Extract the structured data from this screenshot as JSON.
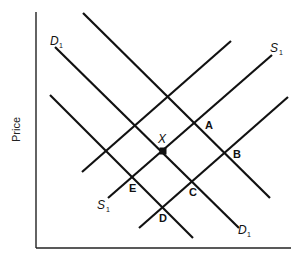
{
  "diagram": {
    "y_axis_label": "Price",
    "x_axis_label": "",
    "curve_labels": {
      "demand_top_left": {
        "main": "D",
        "sub": "1"
      },
      "demand_bottom_right": {
        "main": "D",
        "sub": "1"
      },
      "supply_top_right": {
        "main": "S",
        "sub": "1"
      },
      "supply_bottom_left": {
        "main": "S",
        "sub": "1"
      }
    },
    "points": {
      "x": "X",
      "a": "A",
      "b": "B",
      "c": "C",
      "d": "D",
      "e": "E"
    },
    "demand_curves": [
      "upper demand (unlabeled)",
      "D1",
      "lower demand (unlabeled)"
    ],
    "supply_curves": [
      "upper supply (unlabeled)",
      "S1",
      "lower supply (unlabeled)"
    ],
    "equilibrium": "X at intersection of D1 and S1",
    "colors": {
      "ink": "#111111",
      "background": "#ffffff"
    }
  }
}
